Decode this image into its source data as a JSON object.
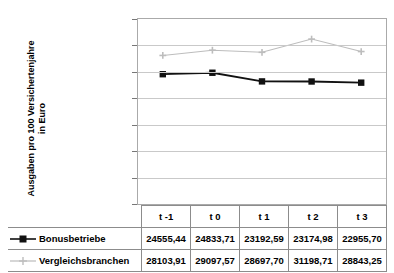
{
  "chart_data": {
    "type": "line",
    "title": "",
    "xlabel": "",
    "ylabel": "Ausgaben pro 100 Versichertenjahre in Euro",
    "ylabel_line1": "Ausgaben pro 100 Versichertenjahre",
    "ylabel_line2": "in Euro",
    "categories": [
      "t -1",
      "t 0",
      "t 1",
      "t 2",
      "t 3"
    ],
    "ylim": [
      0,
      35000
    ],
    "ytick_step": 5000,
    "ytick_labels": [
      "35.000",
      "30.000",
      "25.000",
      "20.000",
      "15.000",
      "10.000",
      "5.000",
      "0"
    ],
    "ytick_values": [
      35000,
      30000,
      25000,
      20000,
      15000,
      10000,
      5000,
      0
    ],
    "grid": true,
    "legend_position": "data-table",
    "series": [
      {
        "name": "Bonusbetriebe",
        "marker": "filled-square",
        "color": "#111111",
        "values": [
          24555.44,
          24833.71,
          23192.59,
          23174.98,
          22955.7
        ],
        "labels": [
          "24555,44",
          "24833,71",
          "23192,59",
          "23174,98",
          "22955,70"
        ]
      },
      {
        "name": "Vergleichsbranchen",
        "marker": "plus",
        "color": "#bdbdbd",
        "values": [
          28103.91,
          29097.57,
          28697.7,
          31198.71,
          28843.25
        ],
        "labels": [
          "28103,91",
          "29097,57",
          "28697,70",
          "31198,71",
          "28843,25"
        ]
      }
    ]
  }
}
